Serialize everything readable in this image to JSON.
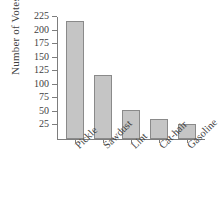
{
  "chart_data": {
    "type": "bar",
    "title": "",
    "xlabel": "",
    "ylabel": "Number of Votes",
    "categories": [
      "Pickle",
      "Sawdust",
      "Lint",
      "Cat-hair",
      "Gasoline"
    ],
    "values": [
      217,
      118,
      54,
      37,
      28
    ],
    "yticks": [
      25,
      50,
      75,
      100,
      125,
      150,
      175,
      200,
      225
    ],
    "ylim": [
      0,
      225
    ],
    "grid": false,
    "legend": false,
    "bar_color": "#c5c5c5",
    "bar_edge_color": "#8a8a8a",
    "axis_color": "#7d7d7d",
    "background_color": "#ffffff",
    "xtick_label_rotation": "-45"
  }
}
